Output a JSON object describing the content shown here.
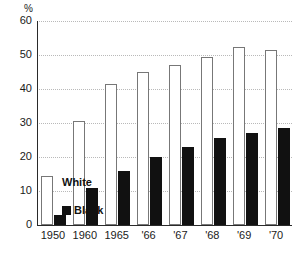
{
  "chart_data": {
    "type": "bar",
    "title": "",
    "xlabel": "",
    "ylabel": "",
    "unit_label": "%",
    "ylim": [
      0,
      60
    ],
    "yticks": [
      0,
      10,
      20,
      30,
      40,
      50,
      60
    ],
    "grid": true,
    "legend_position": "inline-left",
    "categories": [
      "1950",
      "1960",
      "1965",
      "'66",
      "'67",
      "'68",
      "'69",
      "'70"
    ],
    "series": [
      {
        "name": "White",
        "values": [
          14.5,
          30.5,
          41.5,
          45,
          47,
          49.5,
          52.5,
          51.5
        ]
      },
      {
        "name": "Black",
        "values": [
          3,
          11,
          16,
          20,
          23,
          25.5,
          27,
          28.5
        ]
      }
    ]
  },
  "axis": {
    "y_tick_labels": [
      "60",
      "50",
      "40",
      "30",
      "20",
      "10",
      "0"
    ],
    "unit": "%"
  },
  "legend": {
    "white_label": "White",
    "black_label": "Black"
  }
}
